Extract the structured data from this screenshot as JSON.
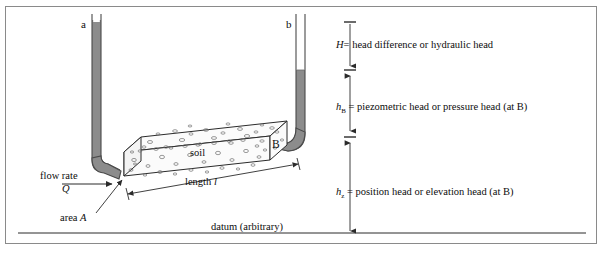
{
  "figure": {
    "background_color": "#ffffff",
    "border_color": "#8a8a8a"
  },
  "colors": {
    "pipe_fill": "#8c8c8c",
    "pipe_stroke": "#4a4a4a",
    "water_fill": "#9a9a9a",
    "soil_fill": "#fbfbfb",
    "soil_stroke": "#2b2b2b",
    "grain_stroke": "#6f6f6f",
    "line": "#2b2b2b",
    "text": "#0d0d0d"
  },
  "standpipes": {
    "left": {
      "label": "a",
      "water_level_note": "nearly full"
    },
    "right": {
      "label": "b",
      "water_level_note": "partially full"
    }
  },
  "soil_column": {
    "material_label": "soil",
    "end_point_label": "B",
    "length_label": "length l",
    "area_label": "area A"
  },
  "flow": {
    "rate_label_line1": "flow rate",
    "rate_label_line2": "Q"
  },
  "datum": {
    "label": "datum (arbitrary)"
  },
  "heads": [
    {
      "symbol": "H",
      "subscript": "",
      "equals": "=",
      "description": "head difference or hydraulic head",
      "full_text": "H = head difference or hydraulic head"
    },
    {
      "symbol": "h",
      "subscript": "B",
      "equals": "=",
      "description": "piezometric head or pressure head  (at B)",
      "full_text": "h_B = piezometric head or pressure head  (at B)"
    },
    {
      "symbol": "h",
      "subscript": "z",
      "equals": "=",
      "description": "position head or elevation head (at B)",
      "full_text": "h_z = position head or elevation head (at B)"
    }
  ]
}
